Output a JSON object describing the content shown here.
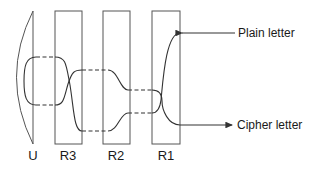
{
  "diagram": {
    "components": [
      {
        "id": "U",
        "label": "U",
        "type": "reflector"
      },
      {
        "id": "R3",
        "label": "R3",
        "type": "rotor"
      },
      {
        "id": "R2",
        "label": "R2",
        "type": "rotor"
      },
      {
        "id": "R1",
        "label": "R1",
        "type": "rotor"
      }
    ],
    "io": {
      "input_label": "Plain letter",
      "output_label": "Cipher letter"
    },
    "colors": {
      "stroke": "#333333",
      "background": "#ffffff"
    }
  }
}
